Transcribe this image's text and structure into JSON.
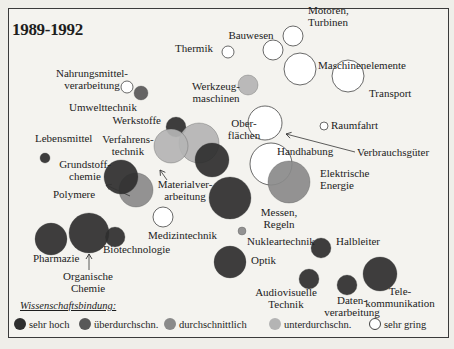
{
  "title": "1989-1992",
  "chart_data": {
    "type": "scatter",
    "subtype": "bubble",
    "title": "1989-1992",
    "xlabel": "",
    "ylabel": "",
    "legend_title": "Wissenschaftsbindung:",
    "legend": [
      {
        "label": "sehr hoch",
        "color": "#2e2e2e"
      },
      {
        "label": "überdurchschn.",
        "color": "#585858"
      },
      {
        "label": "durchschnittlich",
        "color": "#8a8a8a"
      },
      {
        "label": "unterdurchschn.",
        "color": "#b4b4b4"
      },
      {
        "label": "sehr gring",
        "color": "#ffffff"
      }
    ],
    "bubbles": [
      {
        "name": "Nahrungsmittelverarbeitung",
        "x": 127,
        "y": 87,
        "r": 6,
        "level": "sehr gring"
      },
      {
        "name": "Umwelttechnik",
        "x": 141,
        "y": 93,
        "r": 7,
        "level": "überdurchschn."
      },
      {
        "name": "Thermik",
        "x": 228,
        "y": 52,
        "r": 6,
        "level": "sehr gring"
      },
      {
        "name": "Bauwesen",
        "x": 273,
        "y": 50,
        "r": 10,
        "level": "sehr gring"
      },
      {
        "name": "Motoren, Turbinen",
        "x": 293,
        "y": 36,
        "r": 10,
        "level": "sehr gring"
      },
      {
        "name": "Maschinenelemente",
        "x": 300,
        "y": 69,
        "r": 16,
        "level": "sehr gring"
      },
      {
        "name": "Transport",
        "x": 348,
        "y": 76,
        "r": 16,
        "level": "sehr gring"
      },
      {
        "name": "Werkzeugmaschinen",
        "x": 248,
        "y": 85,
        "r": 10,
        "level": "unterdurchschn."
      },
      {
        "name": "Raumfahrt",
        "x": 324,
        "y": 126,
        "r": 4,
        "level": "sehr gring"
      },
      {
        "name": "Werkstoffe",
        "x": 176,
        "y": 127,
        "r": 10,
        "level": "sehr hoch"
      },
      {
        "name": "Materialverarbeitung",
        "x": 199,
        "y": 143,
        "r": 20,
        "level": "unterdurchschn."
      },
      {
        "name": "Verfahrenstechnik",
        "x": 171,
        "y": 146,
        "r": 17,
        "level": "unterdurchschn."
      },
      {
        "name": "Oberflächen",
        "x": 265,
        "y": 123,
        "r": 17,
        "level": "sehr gring"
      },
      {
        "name": "Verbrauchsgüter",
        "x": 212,
        "y": 160,
        "r": 17,
        "level": "sehr hoch"
      },
      {
        "name": "Handhabung",
        "x": 271,
        "y": 164,
        "r": 21,
        "level": "sehr gring"
      },
      {
        "name": "Elektrische Energie",
        "x": 289,
        "y": 182,
        "r": 21,
        "level": "durchschnittlich"
      },
      {
        "name": "Messen, Regeln",
        "x": 230,
        "y": 198,
        "r": 21,
        "level": "sehr hoch"
      },
      {
        "name": "Lebensmittel",
        "x": 45,
        "y": 158,
        "r": 5,
        "level": "sehr hoch"
      },
      {
        "name": "Polymere",
        "x": 136,
        "y": 190,
        "r": 17,
        "level": "durchschnittlich"
      },
      {
        "name": "Grundstoffchemie",
        "x": 121,
        "y": 177,
        "r": 17,
        "level": "sehr hoch"
      },
      {
        "name": "Medizintechnik",
        "x": 163,
        "y": 217,
        "r": 10,
        "level": "sehr gring"
      },
      {
        "name": "Pharmazie",
        "x": 51,
        "y": 239,
        "r": 16,
        "level": "sehr hoch"
      },
      {
        "name": "Organische Chemie",
        "x": 89,
        "y": 233,
        "r": 20,
        "level": "sehr hoch"
      },
      {
        "name": "Biotechnologie",
        "x": 115,
        "y": 237,
        "r": 10,
        "level": "sehr hoch"
      },
      {
        "name": "Nukleartechnik",
        "x": 242,
        "y": 231,
        "r": 4,
        "level": "durchschnittlich"
      },
      {
        "name": "Optik",
        "x": 230,
        "y": 262,
        "r": 16,
        "level": "sehr hoch"
      },
      {
        "name": "Halbleiter",
        "x": 321,
        "y": 248,
        "r": 10,
        "level": "sehr hoch"
      },
      {
        "name": "Audiovisuelle Technik",
        "x": 309,
        "y": 279,
        "r": 10,
        "level": "sehr hoch"
      },
      {
        "name": "Datenverarbeitung",
        "x": 347,
        "y": 285,
        "r": 10,
        "level": "sehr hoch"
      },
      {
        "name": "Telekommunikation",
        "x": 380,
        "y": 274,
        "r": 17,
        "level": "sehr hoch"
      }
    ],
    "labels": [
      {
        "lines": [
          "Motoren,",
          "Turbinen"
        ],
        "x": 308,
        "y": 14,
        "anchor": "start"
      },
      {
        "lines": [
          "Bauwesen"
        ],
        "x": 251,
        "y": 39,
        "anchor": "middle"
      },
      {
        "lines": [
          "Thermik"
        ],
        "x": 213,
        "y": 52,
        "anchor": "end"
      },
      {
        "lines": [
          "Maschinenelemente"
        ],
        "x": 318,
        "y": 69,
        "anchor": "start"
      },
      {
        "lines": [
          "Nahrungsmittel-",
          "verarbeitung"
        ],
        "x": 92,
        "y": 77,
        "anchor": "middle"
      },
      {
        "lines": [
          "Werkzeug-",
          "maschinen"
        ],
        "x": 216,
        "y": 90,
        "anchor": "middle"
      },
      {
        "lines": [
          "Transport"
        ],
        "x": 369,
        "y": 97,
        "anchor": "start"
      },
      {
        "lines": [
          "Umwelttechnik"
        ],
        "x": 103,
        "y": 111,
        "anchor": "middle"
      },
      {
        "lines": [
          "Raumfahrt"
        ],
        "x": 331,
        "y": 129,
        "anchor": "start"
      },
      {
        "lines": [
          "Werkstoffe"
        ],
        "x": 161,
        "y": 124,
        "anchor": "end"
      },
      {
        "lines": [
          "Ober-",
          "flächen"
        ],
        "x": 244,
        "y": 127,
        "anchor": "middle"
      },
      {
        "lines": [
          "Lebensmittel"
        ],
        "x": 35,
        "y": 142,
        "anchor": "start"
      },
      {
        "lines": [
          "Verfahrens-",
          "technik"
        ],
        "x": 128,
        "y": 143,
        "anchor": "middle"
      },
      {
        "lines": [
          "Verbrauchsgüter"
        ],
        "x": 357,
        "y": 156,
        "anchor": "start"
      },
      {
        "lines": [
          "Handhabung"
        ],
        "x": 277,
        "y": 155,
        "anchor": "start"
      },
      {
        "lines": [
          "Grundstoff-",
          "chemie"
        ],
        "x": 85,
        "y": 168,
        "anchor": "middle"
      },
      {
        "lines": [
          "Elektrische",
          "Energie"
        ],
        "x": 320,
        "y": 177,
        "anchor": "start"
      },
      {
        "lines": [
          "Materialver-",
          "arbeitung"
        ],
        "x": 185,
        "y": 188,
        "anchor": "middle"
      },
      {
        "lines": [
          "Polymere"
        ],
        "x": 53,
        "y": 198,
        "anchor": "start"
      },
      {
        "lines": [
          "Messen,",
          "Regeln"
        ],
        "x": 279,
        "y": 216,
        "anchor": "middle"
      },
      {
        "lines": [
          "Medizintechnik"
        ],
        "x": 148,
        "y": 239,
        "anchor": "start"
      },
      {
        "lines": [
          "Nukleartechnik"
        ],
        "x": 247,
        "y": 245,
        "anchor": "start"
      },
      {
        "lines": [
          "Halbleiter"
        ],
        "x": 336,
        "y": 245,
        "anchor": "start"
      },
      {
        "lines": [
          "Biotechnologie"
        ],
        "x": 103,
        "y": 253,
        "anchor": "start"
      },
      {
        "lines": [
          "Optik"
        ],
        "x": 251,
        "y": 264,
        "anchor": "start"
      },
      {
        "lines": [
          "Pharmazie"
        ],
        "x": 33,
        "y": 262,
        "anchor": "start"
      },
      {
        "lines": [
          "Organische",
          "Chemie"
        ],
        "x": 88,
        "y": 280,
        "anchor": "middle"
      },
      {
        "lines": [
          "Audiovisuelle",
          "Technik"
        ],
        "x": 286,
        "y": 296,
        "anchor": "middle"
      },
      {
        "lines": [
          "Tele-",
          "kommunikation"
        ],
        "x": 400,
        "y": 295,
        "anchor": "middle"
      },
      {
        "lines": [
          "Daten-",
          "verarbeitung"
        ],
        "x": 352,
        "y": 304,
        "anchor": "middle"
      }
    ],
    "arrows": [
      {
        "from": [
          130,
          196
        ],
        "to": [
          106,
          185
        ],
        "label_ref": "Polymere"
      },
      {
        "from": [
          167,
          180
        ],
        "to": [
          160,
          170
        ],
        "label_ref": "Materialverarbeitung"
      },
      {
        "from": [
          355,
          152
        ],
        "to": [
          286,
          134
        ],
        "label_ref": "Verbrauchsgüter"
      },
      {
        "from": [
          89,
          270
        ],
        "to": [
          89,
          254
        ],
        "label_ref": "Organische Chemie"
      }
    ]
  }
}
